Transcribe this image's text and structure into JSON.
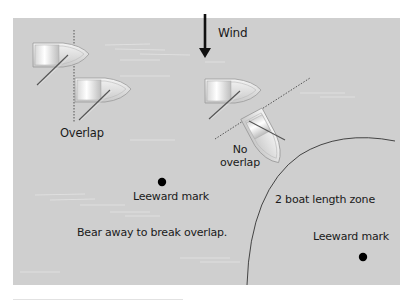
{
  "diagram": {
    "colors": {
      "background": "#cfcfcf",
      "text": "#1a1a1a",
      "mark": "#000000",
      "boat_hull": "#e8e8e8",
      "boat_outline": "#9a9a9a"
    },
    "wind": {
      "label": "Wind",
      "direction": "down"
    },
    "left_scenario": {
      "overlap_label": "Overlap",
      "mark_label": "Leeward mark",
      "instruction": "Bear away to break overlap."
    },
    "right_scenario": {
      "no_overlap_label_line1": "No",
      "no_overlap_label_line2": "overlap",
      "zone_label": "2 boat length zone",
      "mark_label": "Leeward mark"
    }
  }
}
